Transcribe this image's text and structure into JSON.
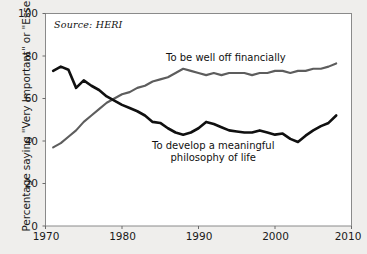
{
  "chart_data": {
    "type": "line",
    "title": "",
    "xlabel": "",
    "ylabel": "Percentage saying \"Very Important\" or \"Essential\"",
    "xlim": [
      1970,
      2010
    ],
    "ylim": [
      0,
      100
    ],
    "xticks": [
      1970,
      1980,
      1990,
      2000,
      2010
    ],
    "yticks": [
      0,
      20,
      40,
      60,
      80,
      100
    ],
    "grid": false,
    "legend_position": "inline-annotations",
    "annotations": [
      {
        "name": "source-note",
        "text": "Source: HERI",
        "x": 1972,
        "y": 93
      }
    ],
    "series": [
      {
        "name": "To be well off financially",
        "color": "#5d5d5d",
        "label_line1": "To be well off financially",
        "x": [
          1971,
          1972,
          1973,
          1974,
          1975,
          1976,
          1977,
          1978,
          1979,
          1980,
          1981,
          1982,
          1983,
          1984,
          1985,
          1986,
          1987,
          1988,
          1989,
          1990,
          1991,
          1992,
          1993,
          1994,
          1995,
          1996,
          1997,
          1998,
          1999,
          2000,
          2001,
          2002,
          2003,
          2004,
          2005,
          2006,
          2007,
          2008
        ],
        "values": [
          37,
          39,
          42,
          45,
          49,
          52,
          55,
          58,
          60,
          62,
          63,
          65,
          66,
          68,
          69,
          70,
          72,
          74,
          73,
          72,
          71,
          72,
          71,
          72,
          72,
          72,
          71,
          72,
          72,
          73,
          73,
          72,
          73,
          73,
          74,
          74,
          75,
          76.5
        ]
      },
      {
        "name": "To develop a meaningful philosophy of life",
        "color": "#101010",
        "label_line1": "To develop a meaningful",
        "label_line2": "philosophy of life",
        "x": [
          1971,
          1972,
          1973,
          1974,
          1975,
          1976,
          1977,
          1978,
          1979,
          1980,
          1981,
          1982,
          1983,
          1984,
          1985,
          1986,
          1987,
          1988,
          1989,
          1990,
          1991,
          1992,
          1993,
          1994,
          1995,
          1996,
          1997,
          1998,
          1999,
          2000,
          2001,
          2002,
          2003,
          2004,
          2005,
          2006,
          2007,
          2008
        ],
        "values": [
          73,
          75,
          73.5,
          65,
          68.5,
          66,
          64,
          61,
          59,
          57,
          55.5,
          54,
          52,
          49,
          48.5,
          46,
          44,
          43,
          44,
          46,
          49,
          48,
          46.5,
          45,
          44.5,
          44,
          44,
          45,
          44,
          43,
          43.5,
          41,
          39.5,
          42.5,
          45,
          47,
          48.5,
          52
        ]
      }
    ]
  },
  "axes": {
    "ytick_labels": [
      "0",
      "20",
      "40",
      "60",
      "80",
      "100"
    ],
    "xtick_labels": [
      "1970",
      "1980",
      "1990",
      "2000",
      "2010"
    ]
  }
}
